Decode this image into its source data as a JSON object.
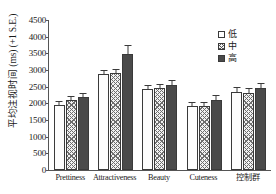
{
  "chart_data": {
    "type": "bar",
    "title": "",
    "xlabel": "",
    "ylabel": "平均注视时间 (ms) (+1 S.E.)",
    "ylim": [
      0,
      4500
    ],
    "ytick_step": 500,
    "yticks": [
      4500,
      4000,
      3500,
      3000,
      2500,
      2000,
      1500,
      1000,
      500,
      0
    ],
    "ytick_labels": [
      "4500",
      "4000",
      "3500",
      "3000",
      "2500",
      "2000",
      "1500",
      "1000",
      "500",
      "0"
    ],
    "grid": false,
    "legend_position": "top-right",
    "categories": [
      "Prettiness",
      "Attractiveness",
      "Beauty",
      "Cuteness",
      "控制群"
    ],
    "series": [
      {
        "name": "低",
        "fill": "white-dotted",
        "values": [
          1950,
          2880,
          2430,
          1930,
          2350
        ],
        "errors": [
          110,
          130,
          120,
          110,
          130
        ]
      },
      {
        "name": "中",
        "fill": "cross-hatched",
        "values": [
          2100,
          2900,
          2470,
          1930,
          2320
        ],
        "errors": [
          120,
          140,
          120,
          110,
          130
        ]
      },
      {
        "name": "高",
        "fill": "dark-solid",
        "values": [
          2200,
          3470,
          2550,
          2100,
          2470
        ],
        "errors": [
          120,
          270,
          140,
          140,
          150
        ]
      }
    ]
  },
  "legend": {
    "items": [
      {
        "label": "低",
        "style": "low"
      },
      {
        "label": "中",
        "style": "mid"
      },
      {
        "label": "高",
        "style": "high"
      }
    ]
  }
}
